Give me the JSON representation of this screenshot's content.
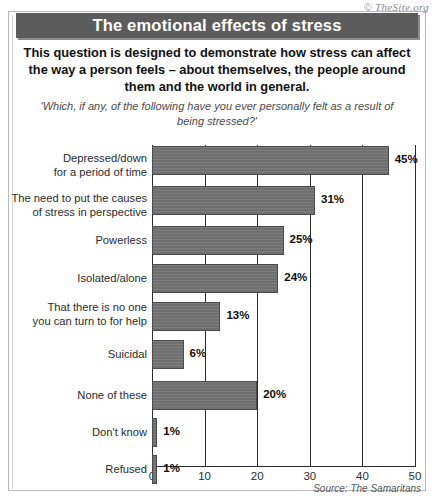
{
  "copyright": "© TheSite.org",
  "title": "The emotional effects of stress",
  "intro": "This question is designed to demonstrate how stress can affect the way a person feels – about themselves, the people around them and the world in general.",
  "question": "'Which, if any, of the following have you ever personally felt as a result of being stressed?'",
  "source": "Source: The Samaritans",
  "colors": {
    "title_bar": "#5c5c5c",
    "title_text": "#ffffff",
    "bar_fill": "#6f6f6f",
    "bar_border": "#4a4a4a",
    "axis": "#2b2b2b",
    "background": "#ffffff"
  },
  "chart_data": {
    "type": "bar",
    "orientation": "horizontal",
    "title": "The emotional effects of stress",
    "subtitle": "'Which, if any, of the following have you ever personally felt as a result of being stressed?'",
    "xlabel": "",
    "ylabel": "",
    "xlim": [
      0,
      50
    ],
    "xticks": [
      0,
      10,
      20,
      30,
      40,
      50
    ],
    "xtick_labels": [
      "0",
      "10",
      "20",
      "30",
      "40",
      "50"
    ],
    "grid": "vertical",
    "legend": "none",
    "unit": "%",
    "categories": [
      "Depressed/down\nfor a period of time",
      "The need to put the causes\nof stress in perspective",
      "Powerless",
      "Isolated/alone",
      "That there is no one\nyou can turn to for help",
      "Suicidal",
      "None of these",
      "Don't know",
      "Refused"
    ],
    "values": [
      45,
      31,
      25,
      24,
      13,
      6,
      20,
      1,
      1
    ],
    "value_labels": [
      "45%",
      "31%",
      "25%",
      "24%",
      "13%",
      "6%",
      "20%",
      "1%",
      "1%"
    ]
  },
  "layout": {
    "rows": [
      {
        "bar_top": 146,
        "bar_height": 29,
        "label_top": 151
      },
      {
        "bar_top": 186,
        "bar_height": 29,
        "label_top": 191
      },
      {
        "bar_top": 226,
        "bar_height": 29,
        "label_top": 233
      },
      {
        "bar_top": 264,
        "bar_height": 29,
        "label_top": 271
      },
      {
        "bar_top": 302,
        "bar_height": 29,
        "label_top": 300
      },
      {
        "bar_top": 340,
        "bar_height": 29,
        "label_top": 347
      },
      {
        "bar_top": 381,
        "bar_height": 29,
        "label_top": 388
      },
      {
        "bar_top": 418,
        "bar_height": 29,
        "label_top": 425
      },
      {
        "bar_top": 455,
        "bar_height": 29,
        "label_top": 462
      }
    ]
  }
}
